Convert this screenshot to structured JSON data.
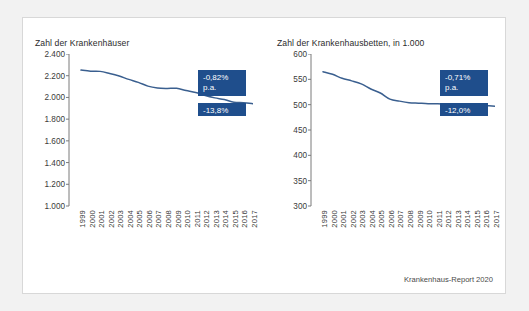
{
  "caption": "Krankenhaus-Report 2020",
  "colors": {
    "line": "#3a5f8f",
    "badge": "#1f4e8c",
    "axis": "#7a7a7a",
    "panel_bg": "#ffffff",
    "page_bg": "#f2f2f2"
  },
  "charts": [
    {
      "id": "hospitals",
      "title": "Zahl der Krankenhäuser",
      "badge_rate": "-0,82%\np.a.",
      "badge_total": "-13,8%",
      "chart_data": {
        "type": "line",
        "title": "Zahl der Krankenhäuser",
        "xlabel": "",
        "ylabel": "",
        "grid": false,
        "legend": "none",
        "ylim": [
          1000,
          2400
        ],
        "yticks": [
          "1.000",
          "1.200",
          "1.400",
          "1.600",
          "1.800",
          "2.000",
          "2.200",
          "2.400"
        ],
        "ytick_values": [
          1000,
          1200,
          1400,
          1600,
          1800,
          2000,
          2200,
          2400
        ],
        "categories": [
          "1999",
          "2000",
          "2001",
          "2002",
          "2003",
          "2004",
          "2005",
          "2006",
          "2007",
          "2008",
          "2009",
          "2010",
          "2011",
          "2012",
          "2013",
          "2014",
          "2015",
          "2016",
          "2017"
        ],
        "values": [
          2252,
          2242,
          2240,
          2221,
          2197,
          2166,
          2139,
          2104,
          2087,
          2083,
          2084,
          2064,
          2045,
          2017,
          1996,
          1980,
          1956,
          1951,
          1942
        ]
      }
    },
    {
      "id": "beds",
      "title": "Zahl der Krankenhausbetten, in 1.000",
      "badge_rate": "-0,71%\np.a.",
      "badge_total": "-12,0%",
      "chart_data": {
        "type": "line",
        "title": "Zahl der Krankenhausbetten, in 1.000",
        "xlabel": "",
        "ylabel": "",
        "grid": false,
        "legend": "none",
        "ylim": [
          300,
          600
        ],
        "yticks": [
          "300",
          "350",
          "400",
          "450",
          "500",
          "550",
          "600"
        ],
        "ytick_values": [
          300,
          350,
          400,
          450,
          500,
          550,
          600
        ],
        "categories": [
          "1999",
          "2000",
          "2001",
          "2002",
          "2003",
          "2004",
          "2005",
          "2006",
          "2007",
          "2008",
          "2009",
          "2010",
          "2011",
          "2012",
          "2013",
          "2014",
          "2015",
          "2016",
          "2017"
        ],
        "values": [
          565,
          560,
          552,
          547,
          541,
          531,
          523,
          511,
          507,
          504,
          503,
          502,
          502,
          501,
          501,
          500,
          499,
          498,
          497
        ]
      }
    }
  ]
}
